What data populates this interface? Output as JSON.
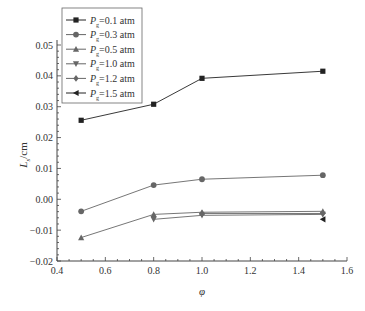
{
  "chart_data": {
    "type": "line",
    "title": "",
    "xlabel": "φ",
    "ylabel": "L_s/cm",
    "ylabel_main": "L",
    "ylabel_sub": "s",
    "ylabel_unit": "/cm",
    "xlim": [
      0.4,
      1.6
    ],
    "ylim": [
      -0.02,
      0.05
    ],
    "x_ticks": [
      0.4,
      0.6,
      0.8,
      1.0,
      1.2,
      1.4,
      1.6
    ],
    "x_tick_labels": [
      "0.4",
      "0.6",
      "0.8",
      "1.0",
      "1.2",
      "1.4",
      "1.6"
    ],
    "y_ticks": [
      -0.02,
      -0.01,
      0.0,
      0.01,
      0.02,
      0.03,
      0.04,
      0.05
    ],
    "y_tick_labels": [
      "−0.02",
      "−0.01",
      "0.00",
      "0.01",
      "0.02",
      "0.03",
      "0.04",
      "0.05"
    ],
    "grid": false,
    "legend_position": "upper left",
    "series": [
      {
        "name": "P_g=0.1 atm",
        "label_sub": "g",
        "label_value": "=0.1 atm",
        "marker": "square",
        "color": "#222222",
        "x": [
          0.5,
          0.8,
          1.0,
          1.5
        ],
        "values": [
          0.0256,
          0.0308,
          0.0392,
          0.0415
        ]
      },
      {
        "name": "P_g=0.3 atm",
        "label_sub": "g",
        "label_value": "=0.3 atm",
        "marker": "circle",
        "color": "#666666",
        "x": [
          0.5,
          0.8,
          1.0,
          1.5
        ],
        "values": [
          -0.0039,
          0.0046,
          0.0065,
          0.0078
        ]
      },
      {
        "name": "P_g=0.5 atm",
        "label_sub": "g",
        "label_value": "=0.5 atm",
        "marker": "triangle-up",
        "color": "#666666",
        "x": [
          0.5,
          0.8,
          1.0,
          1.5
        ],
        "values": [
          -0.0124,
          -0.0049,
          -0.0042,
          -0.0039
        ]
      },
      {
        "name": "P_g=1.0 atm",
        "label_sub": "g",
        "label_value": "=1.0 atm",
        "marker": "triangle-down",
        "color": "#666666",
        "x": [
          0.8,
          1.0,
          1.5
        ],
        "values": [
          -0.0065,
          -0.0052,
          -0.0049
        ]
      },
      {
        "name": "P_g=1.2 atm",
        "label_sub": "g",
        "label_value": "=1.2 atm",
        "marker": "diamond",
        "color": "#666666",
        "x": [
          1.0,
          1.5
        ],
        "values": [
          -0.0046,
          -0.0046
        ]
      },
      {
        "name": "P_g=1.5 atm",
        "label_sub": "g",
        "label_value": "=1.5 atm",
        "marker": "triangle-left",
        "color": "#222222",
        "x": [
          1.5
        ],
        "values": [
          -0.0065
        ]
      }
    ]
  }
}
